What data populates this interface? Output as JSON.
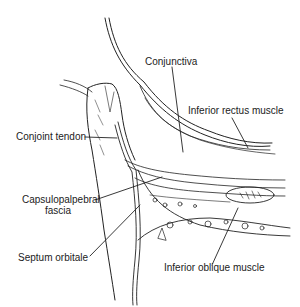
{
  "diagram": {
    "labels": {
      "conjunctiva": "Conjunctiva",
      "inferior_rectus": "Inferior rectus muscle",
      "conjoint_tendon": "Conjoint tendon",
      "capsulopalpebral_line1": "Capsulopalpebral",
      "capsulopalpebral_line2": "fascia",
      "septum_orbitale": "Septum orbitale",
      "inferior_oblique": "Inferior oblique muscle"
    },
    "colors": {
      "ink": "#222222",
      "background": "#ffffff"
    }
  }
}
